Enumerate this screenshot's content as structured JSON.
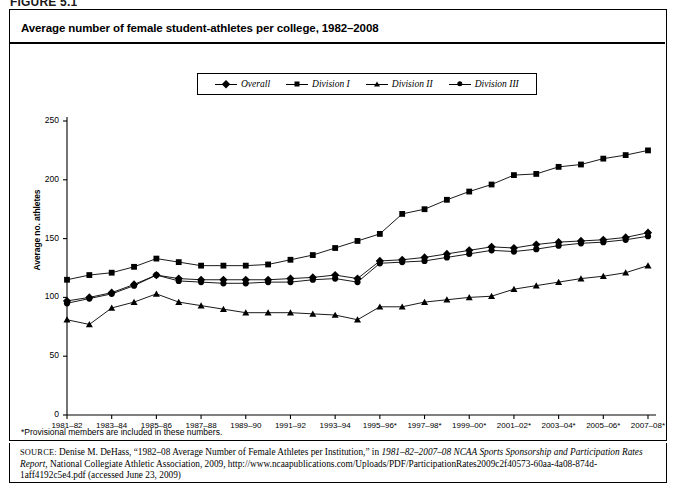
{
  "figure": {
    "number_label": "FIGURE 5.1"
  },
  "chart_panel": {
    "title": "Average number of female student-athletes per college, 1982–2008",
    "footnote": "*Provisional members are included in these numbers."
  },
  "legend": {
    "position": "top-center",
    "items": [
      {
        "label": "Overall",
        "marker": "diamond-marker"
      },
      {
        "label": "Division I",
        "marker": "square-marker"
      },
      {
        "label": "Division II",
        "marker": "triangle-marker"
      },
      {
        "label": "Division III",
        "marker": "circle-marker"
      }
    ]
  },
  "source": {
    "prefix": "SOURCE:",
    "part1": " Denise M. DeHass, “1982–08 Average Number of Female Athletes per Institution,” in ",
    "italic1": "1981–82–2007–08 NCAA Sports Sponsorship and Participation Rates Report",
    "part2": ", National Collegiate Athletic Association, 2009, http://www.ncaapublications.com/Uploads/PDF/ParticipationRates2009c2f40573-60aa-4a08-874d-1aff4192c5e4.pdf (accessed June 23, 2009)"
  },
  "chart_data": {
    "type": "line",
    "title": "Average number of female student-athletes per college, 1982–2008",
    "xlabel": "",
    "ylabel": "Average no. athletes",
    "ylim": [
      0,
      250
    ],
    "yticks": [
      0,
      50,
      100,
      150,
      200,
      250
    ],
    "grid": false,
    "legend_position": "top-center",
    "x": [
      "1981–82",
      "1982–83",
      "1983–84",
      "1984–85",
      "1985–86",
      "1986–87",
      "1987–88",
      "1988–89",
      "1989–90",
      "1990–91",
      "1991–92",
      "1992–93",
      "1993–94",
      "1994–95",
      "1995–96*",
      "1996–97*",
      "1997–98*",
      "1998–99*",
      "1999–00*",
      "2000–01*",
      "2001–02*",
      "2002–03*",
      "2003–04*",
      "2004–05*",
      "2005–06*",
      "2006–07*",
      "2007–08*"
    ],
    "xtick_labels": [
      "1981–82",
      "1983–84",
      "1985–86",
      "1987–88",
      "1989–90",
      "1991–92",
      "1993–94",
      "1995–96*",
      "1997–98*",
      "1999–00*",
      "2001–02*",
      "2003–04*",
      "2005–06*",
      "2007–08*"
    ],
    "series": [
      {
        "name": "Overall",
        "marker": "diamond",
        "values": [
          97,
          100,
          104,
          111,
          119,
          116,
          115,
          115,
          115,
          115,
          116,
          117,
          119,
          116,
          131,
          132,
          134,
          137,
          140,
          143,
          142,
          145,
          147,
          148,
          149,
          151,
          155
        ]
      },
      {
        "name": "Division I",
        "marker": "square",
        "values": [
          115,
          119,
          121,
          126,
          133,
          130,
          127,
          127,
          127,
          128,
          132,
          136,
          142,
          148,
          154,
          171,
          175,
          183,
          190,
          196,
          204,
          205,
          211,
          213,
          218,
          221,
          225
        ]
      },
      {
        "name": "Division II",
        "marker": "triangle",
        "values": [
          81,
          77,
          91,
          96,
          103,
          96,
          93,
          90,
          87,
          87,
          87,
          86,
          85,
          81,
          92,
          92,
          96,
          98,
          100,
          101,
          107,
          110,
          113,
          116,
          118,
          121,
          127
        ]
      },
      {
        "name": "Division III",
        "marker": "circle",
        "values": [
          95,
          99,
          103,
          110,
          119,
          114,
          113,
          112,
          112,
          113,
          113,
          115,
          116,
          113,
          129,
          130,
          131,
          134,
          137,
          140,
          139,
          141,
          144,
          146,
          147,
          149,
          152
        ]
      }
    ]
  }
}
